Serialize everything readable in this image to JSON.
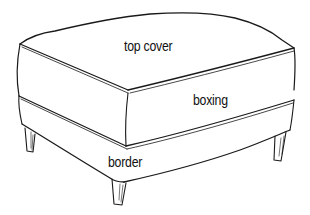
{
  "diagram": {
    "labels": {
      "top_cover": "top cover",
      "boxing": "boxing",
      "border": "border"
    },
    "colors": {
      "ink": "#1a1a1a",
      "background": "#ffffff"
    }
  }
}
